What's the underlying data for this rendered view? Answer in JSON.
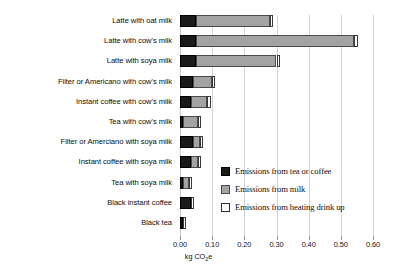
{
  "chart_data": {
    "type": "bar",
    "orientation": "horizontal",
    "stacked": true,
    "title": "",
    "xlabel": "kg CO2e",
    "xlabel_display": "kg CO₂e",
    "ylabel": "",
    "xlim": [
      0.0,
      0.6
    ],
    "xticks": [
      0.0,
      0.1,
      0.2,
      0.3,
      0.4,
      0.5,
      0.6
    ],
    "xticklabels": [
      "0.00",
      "0.10",
      "0.20",
      "0.30",
      "0.40",
      "0.50",
      "0.60"
    ],
    "grid": "vertical",
    "legend_position": "center-right-inside",
    "categories": [
      "Latte with oat milk",
      "Latte with cow's milk",
      "Latte with soya milk",
      "Filter or Americano with cow's milk",
      "Instant coffee with cow's milk",
      "Tea with cow's milk",
      "Filter or Amerciano with soya milk",
      "Instant coffee with soya milk",
      "Tea with soya milk",
      "Black instant coffee",
      "Black tea"
    ],
    "series": [
      {
        "name": "Emissions from tea or coffee",
        "color": "#1a1a1a",
        "values": [
          0.05,
          0.05,
          0.05,
          0.04,
          0.035,
          0.008,
          0.04,
          0.035,
          0.008,
          0.035,
          0.008
        ]
      },
      {
        "name": "Emissions from milk",
        "color": "#a3a3a3",
        "values": [
          0.23,
          0.492,
          0.25,
          0.058,
          0.05,
          0.047,
          0.023,
          0.02,
          0.02,
          0.0,
          0.0
        ]
      },
      {
        "name": "Emissions from heating drink up",
        "color": "#ffffff",
        "values": [
          0.009,
          0.01,
          0.01,
          0.01,
          0.01,
          0.01,
          0.01,
          0.01,
          0.01,
          0.01,
          0.01
        ]
      }
    ],
    "totals": [
      0.289,
      0.552,
      0.31,
      0.108,
      0.095,
      0.065,
      0.073,
      0.065,
      0.038,
      0.045,
      0.018
    ]
  },
  "legend": {
    "items": [
      {
        "label": "Emissions from tea or coffee",
        "swatch": "coffee"
      },
      {
        "label": "Emissions from milk",
        "swatch": "milk"
      },
      {
        "label": "Emissions from heating drink up",
        "swatch": "heat"
      }
    ]
  }
}
